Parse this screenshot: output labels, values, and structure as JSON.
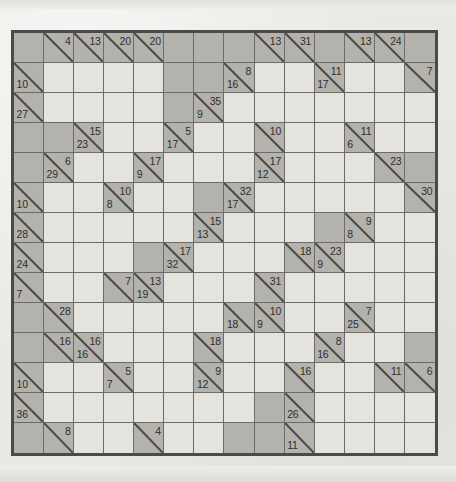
{
  "puzzle": {
    "type": "kakuro",
    "rows": 14,
    "cols": 14,
    "colors": {
      "paper": "#ebe9e5",
      "block": "#b4b2ad",
      "white": "#e4e3de",
      "gridline": "#6d6b67",
      "border": "#4a4a4a",
      "clue_text": "#2e2e2c"
    },
    "legend": {
      "down_position": "upper-right",
      "across_position": "lower-left"
    },
    "cells": [
      [
        {
          "t": "block"
        },
        {
          "t": "clue",
          "down": "4"
        },
        {
          "t": "clue",
          "down": "13"
        },
        {
          "t": "clue",
          "down": "20"
        },
        {
          "t": "clue",
          "down": "20"
        },
        {
          "t": "block"
        },
        {
          "t": "block"
        },
        {
          "t": "block"
        },
        {
          "t": "clue",
          "down": "13"
        },
        {
          "t": "clue",
          "down": "31"
        },
        {
          "t": "block"
        },
        {
          "t": "clue",
          "down": "13"
        },
        {
          "t": "clue",
          "down": "24"
        },
        {
          "t": "block"
        }
      ],
      [
        {
          "t": "clue",
          "across": "10"
        },
        {
          "t": "white"
        },
        {
          "t": "white"
        },
        {
          "t": "white"
        },
        {
          "t": "white"
        },
        {
          "t": "block"
        },
        {
          "t": "block"
        },
        {
          "t": "clue",
          "down": "8",
          "across": "16"
        },
        {
          "t": "white"
        },
        {
          "t": "white"
        },
        {
          "t": "clue",
          "down": "11",
          "across": "17"
        },
        {
          "t": "white"
        },
        {
          "t": "white"
        },
        {
          "t": "clue",
          "down": "7"
        }
      ],
      [
        {
          "t": "clue",
          "across": "27"
        },
        {
          "t": "white"
        },
        {
          "t": "white"
        },
        {
          "t": "white"
        },
        {
          "t": "white"
        },
        {
          "t": "block"
        },
        {
          "t": "clue",
          "down": "35",
          "across": "9"
        },
        {
          "t": "white"
        },
        {
          "t": "white"
        },
        {
          "t": "white"
        },
        {
          "t": "white"
        },
        {
          "t": "white"
        },
        {
          "t": "white"
        },
        {
          "t": "white"
        }
      ],
      [
        {
          "t": "block"
        },
        {
          "t": "block"
        },
        {
          "t": "clue",
          "down": "15",
          "across": "23"
        },
        {
          "t": "white"
        },
        {
          "t": "white"
        },
        {
          "t": "clue",
          "down": "5",
          "across": "17"
        },
        {
          "t": "white"
        },
        {
          "t": "white"
        },
        {
          "t": "clue",
          "down": "10"
        },
        {
          "t": "white"
        },
        {
          "t": "white"
        },
        {
          "t": "clue",
          "down": "11",
          "across": "6"
        },
        {
          "t": "white"
        },
        {
          "t": "white"
        }
      ],
      [
        {
          "t": "block"
        },
        {
          "t": "clue",
          "down": "6",
          "across": "29"
        },
        {
          "t": "white"
        },
        {
          "t": "white"
        },
        {
          "t": "clue",
          "down": "17",
          "across": "9"
        },
        {
          "t": "white"
        },
        {
          "t": "white"
        },
        {
          "t": "white"
        },
        {
          "t": "clue",
          "down": "17",
          "across": "12"
        },
        {
          "t": "white"
        },
        {
          "t": "white"
        },
        {
          "t": "white"
        },
        {
          "t": "clue",
          "down": "23"
        },
        {
          "t": "block"
        }
      ],
      [
        {
          "t": "clue",
          "across": "10"
        },
        {
          "t": "white"
        },
        {
          "t": "white"
        },
        {
          "t": "clue",
          "down": "10",
          "across": "8"
        },
        {
          "t": "white"
        },
        {
          "t": "white"
        },
        {
          "t": "block"
        },
        {
          "t": "clue",
          "down": "32",
          "across": "17"
        },
        {
          "t": "white"
        },
        {
          "t": "white"
        },
        {
          "t": "white"
        },
        {
          "t": "white"
        },
        {
          "t": "white"
        },
        {
          "t": "clue",
          "down": "30"
        }
      ],
      [
        {
          "t": "clue",
          "across": "28"
        },
        {
          "t": "white"
        },
        {
          "t": "white"
        },
        {
          "t": "white"
        },
        {
          "t": "white"
        },
        {
          "t": "white"
        },
        {
          "t": "clue",
          "down": "15",
          "across": "13"
        },
        {
          "t": "white"
        },
        {
          "t": "white"
        },
        {
          "t": "white"
        },
        {
          "t": "block"
        },
        {
          "t": "clue",
          "down": "9",
          "across": "8"
        },
        {
          "t": "white"
        },
        {
          "t": "white"
        }
      ],
      [
        {
          "t": "clue",
          "across": "24"
        },
        {
          "t": "white"
        },
        {
          "t": "white"
        },
        {
          "t": "white"
        },
        {
          "t": "block"
        },
        {
          "t": "clue",
          "down": "17",
          "across": "32"
        },
        {
          "t": "white"
        },
        {
          "t": "white"
        },
        {
          "t": "white"
        },
        {
          "t": "clue",
          "down": "18"
        },
        {
          "t": "clue",
          "down": "23",
          "across": "9"
        },
        {
          "t": "white"
        },
        {
          "t": "white"
        },
        {
          "t": "white"
        }
      ],
      [
        {
          "t": "clue",
          "across": "7"
        },
        {
          "t": "white"
        },
        {
          "t": "white"
        },
        {
          "t": "clue",
          "down": "7"
        },
        {
          "t": "clue",
          "down": "13",
          "across": "19"
        },
        {
          "t": "white"
        },
        {
          "t": "white"
        },
        {
          "t": "white"
        },
        {
          "t": "clue",
          "down": "31"
        },
        {
          "t": "white"
        },
        {
          "t": "white"
        },
        {
          "t": "white"
        },
        {
          "t": "white"
        },
        {
          "t": "white"
        }
      ],
      [
        {
          "t": "block"
        },
        {
          "t": "clue",
          "down": "28"
        },
        {
          "t": "white"
        },
        {
          "t": "white"
        },
        {
          "t": "white"
        },
        {
          "t": "white"
        },
        {
          "t": "white"
        },
        {
          "t": "clue",
          "across": "18"
        },
        {
          "t": "clue",
          "down": "10",
          "across": "9"
        },
        {
          "t": "white"
        },
        {
          "t": "white"
        },
        {
          "t": "clue",
          "down": "7",
          "across": "25"
        },
        {
          "t": "white"
        },
        {
          "t": "white"
        }
      ],
      [
        {
          "t": "block"
        },
        {
          "t": "clue",
          "down": "16"
        },
        {
          "t": "clue",
          "down": "16",
          "across": "16"
        },
        {
          "t": "white"
        },
        {
          "t": "white"
        },
        {
          "t": "white"
        },
        {
          "t": "clue",
          "down": "18"
        },
        {
          "t": "white"
        },
        {
          "t": "white"
        },
        {
          "t": "white"
        },
        {
          "t": "clue",
          "down": "8",
          "across": "16"
        },
        {
          "t": "white"
        },
        {
          "t": "white"
        },
        {
          "t": "block"
        }
      ],
      [
        {
          "t": "clue",
          "across": "10"
        },
        {
          "t": "white"
        },
        {
          "t": "white"
        },
        {
          "t": "clue",
          "down": "5",
          "across": "7"
        },
        {
          "t": "white"
        },
        {
          "t": "white"
        },
        {
          "t": "clue",
          "down": "9",
          "across": "12"
        },
        {
          "t": "white"
        },
        {
          "t": "white"
        },
        {
          "t": "clue",
          "down": "16"
        },
        {
          "t": "white"
        },
        {
          "t": "white"
        },
        {
          "t": "clue",
          "down": "11"
        },
        {
          "t": "clue",
          "down": "6"
        }
      ],
      [
        {
          "t": "clue",
          "across": "36"
        },
        {
          "t": "white"
        },
        {
          "t": "white"
        },
        {
          "t": "white"
        },
        {
          "t": "white"
        },
        {
          "t": "white"
        },
        {
          "t": "white"
        },
        {
          "t": "white"
        },
        {
          "t": "block"
        },
        {
          "t": "clue",
          "across": "26"
        },
        {
          "t": "white"
        },
        {
          "t": "white"
        },
        {
          "t": "white"
        },
        {
          "t": "white"
        }
      ],
      [
        {
          "t": "block"
        },
        {
          "t": "clue",
          "down": "8"
        },
        {
          "t": "white"
        },
        {
          "t": "white"
        },
        {
          "t": "clue",
          "down": "4"
        },
        {
          "t": "white"
        },
        {
          "t": "white"
        },
        {
          "t": "block"
        },
        {
          "t": "block"
        },
        {
          "t": "clue",
          "across": "11"
        },
        {
          "t": "white"
        },
        {
          "t": "white"
        },
        {
          "t": "white"
        },
        {
          "t": "white"
        }
      ]
    ]
  }
}
